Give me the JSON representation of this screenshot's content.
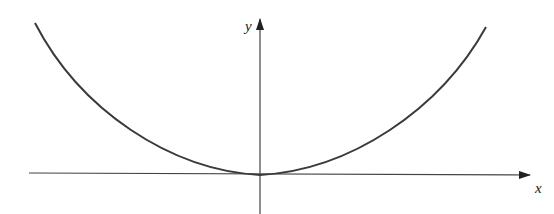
{
  "figure": {
    "type": "graph",
    "x_axis_label": "x",
    "y_axis_label": "y",
    "colors": {
      "curve": "#3a3a3a",
      "axes": "#333333",
      "background": "#ffffff"
    }
  }
}
